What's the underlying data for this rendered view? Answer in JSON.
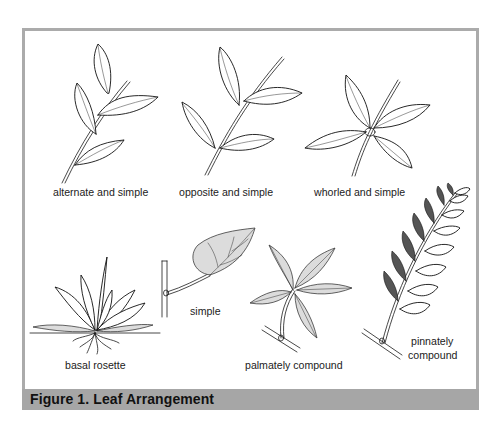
{
  "figure": {
    "caption": "Figure 1. Leaf Arrangement",
    "colors": {
      "frame_border": "#ababab",
      "caption_bar": "#a6a6a6",
      "caption_text": "#111111",
      "line_art": "#1a1a1a"
    },
    "panels": [
      {
        "id": "alternate-simple",
        "label": "alternate and simple",
        "icon": "alternate-leaf-arrangement-icon"
      },
      {
        "id": "opposite-simple",
        "label": "opposite and simple",
        "icon": "opposite-leaf-arrangement-icon"
      },
      {
        "id": "whorled-simple",
        "label": "whorled and simple",
        "icon": "whorled-leaf-arrangement-icon"
      },
      {
        "id": "basal-rosette",
        "label": "basal rosette",
        "icon": "basal-rosette-icon"
      },
      {
        "id": "simple",
        "label": "simple",
        "icon": "simple-leaf-icon"
      },
      {
        "id": "palmately-compound",
        "label": "palmately compound",
        "icon": "palmately-compound-leaf-icon"
      },
      {
        "id": "pinnately-compound",
        "label_line1": "pinnately",
        "label_line2": "compound",
        "icon": "pinnately-compound-leaf-icon"
      }
    ]
  }
}
